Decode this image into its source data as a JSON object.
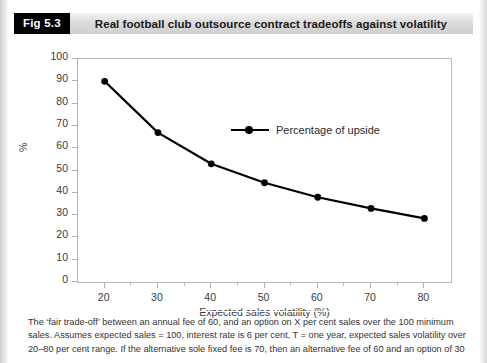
{
  "header": {
    "figure_number": "Fig 5.3",
    "title": "Real football club outsource contract tradeoffs against volatility"
  },
  "chart_data": {
    "type": "line",
    "title": "Real football club outsource contract tradeoffs against volatility",
    "xlabel": "Expected sales volatility (%)",
    "ylabel": "%",
    "xlim": [
      15,
      85
    ],
    "ylim": [
      0,
      100
    ],
    "grid": false,
    "legend_position": "upper-right-inside",
    "series": [
      {
        "name": "Percentage of upside",
        "color": "#000000",
        "marker": "circle",
        "x": [
          20,
          30,
          40,
          50,
          60,
          70,
          80
        ],
        "values": [
          90,
          67,
          53,
          44.5,
          38,
          33,
          28.5
        ]
      }
    ],
    "x_ticks": [
      20,
      30,
      40,
      50,
      60,
      70,
      80
    ],
    "y_ticks": [
      0,
      10,
      20,
      30,
      40,
      50,
      60,
      70,
      80,
      90,
      100
    ]
  },
  "legend": {
    "entries": [
      {
        "label": "Percentage of upside"
      }
    ]
  },
  "caption": {
    "lines": [
      "The ‘fair trade-off’ between an annual fee of 60, and an option on X per cent sales over the 100 minimum",
      "sales. Assumes expected sales = 100, interest rate is 6 per cent, T = one year, expected sales volatility over",
      "20–80 per cent range. If the alternative sole fixed fee is 70, then an alternative fee of 60 and an option of 30"
    ]
  }
}
